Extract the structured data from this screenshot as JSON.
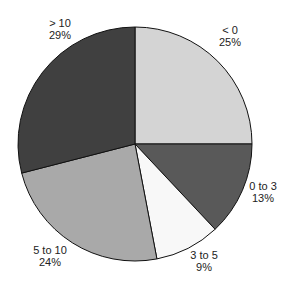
{
  "chart_data": {
    "type": "pie",
    "title": "",
    "start_angle_deg": 90,
    "direction": "clockwise",
    "categories": [
      "< 0",
      "0 to 3",
      "3 to 5",
      "5 to 10",
      "> 10"
    ],
    "values": [
      25,
      13,
      9,
      24,
      29
    ],
    "value_labels": [
      "25%",
      "13%",
      "9%",
      "24%",
      "29%"
    ],
    "colors": [
      "#d4d4d4",
      "#595959",
      "#f8f8f8",
      "#a9a9a9",
      "#404040"
    ],
    "legend": "none",
    "label_position": "outside"
  },
  "geometry": {
    "cx": 135,
    "cy": 144,
    "r": 117
  },
  "labels": [
    {
      "name": "< 0",
      "pct": "25%",
      "x": 230,
      "y": 34
    },
    {
      "name": "0 to 3",
      "pct": "13%",
      "x": 263,
      "y": 190
    },
    {
      "name": "3 to 5",
      "pct": "9%",
      "x": 204,
      "y": 259
    },
    {
      "name": "5 to 10",
      "pct": "24%",
      "x": 50,
      "y": 254
    },
    {
      "name": "> 10",
      "pct": "29%",
      "x": 60,
      "y": 27
    }
  ]
}
